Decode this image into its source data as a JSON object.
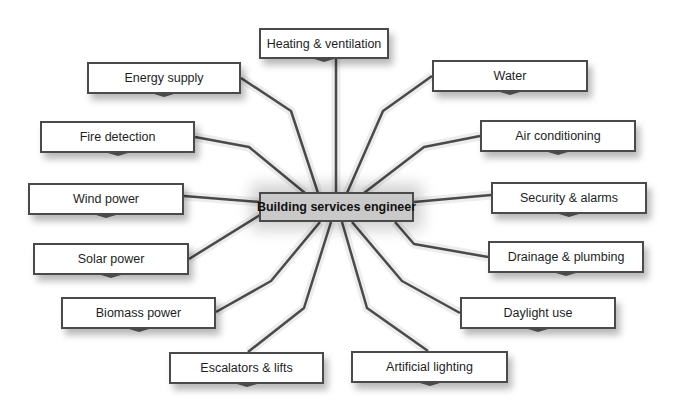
{
  "diagram": {
    "type": "mind-map",
    "center": {
      "label": "Building services engineer",
      "x": 259,
      "y": 192,
      "w": 155,
      "h": 30
    },
    "line_color": "#4a4a4a",
    "center_fill": "#c9c9c9",
    "nodes": [
      {
        "id": "heating",
        "label": "Heating & ventilation",
        "x": 259,
        "y": 28,
        "w": 130,
        "h": 31
      },
      {
        "id": "energy",
        "label": "Energy supply",
        "x": 87,
        "y": 62,
        "w": 154,
        "h": 32
      },
      {
        "id": "water",
        "label": "Water",
        "x": 432,
        "y": 60,
        "w": 156,
        "h": 32
      },
      {
        "id": "fire",
        "label": "Fire detection",
        "x": 40,
        "y": 121,
        "w": 155,
        "h": 32
      },
      {
        "id": "aircon",
        "label": "Air conditioning",
        "x": 480,
        "y": 120,
        "w": 156,
        "h": 32
      },
      {
        "id": "wind",
        "label": "Wind power",
        "x": 28,
        "y": 183,
        "w": 156,
        "h": 32
      },
      {
        "id": "security",
        "label": "Security & alarms",
        "x": 491,
        "y": 182,
        "w": 156,
        "h": 32
      },
      {
        "id": "solar",
        "label": "Solar power",
        "x": 33,
        "y": 243,
        "w": 156,
        "h": 32
      },
      {
        "id": "drainage",
        "label": "Drainage & plumbing",
        "x": 488,
        "y": 241,
        "w": 156,
        "h": 32
      },
      {
        "id": "biomass",
        "label": "Biomass power",
        "x": 61,
        "y": 297,
        "w": 155,
        "h": 32
      },
      {
        "id": "daylight",
        "label": "Daylight use",
        "x": 460,
        "y": 297,
        "w": 156,
        "h": 32
      },
      {
        "id": "escalators",
        "label": "Escalators & lifts",
        "x": 169,
        "y": 352,
        "w": 155,
        "h": 32
      },
      {
        "id": "lighting",
        "label": "Artificial lighting",
        "x": 351,
        "y": 351,
        "w": 157,
        "h": 32
      }
    ],
    "links": [
      {
        "to": "heating",
        "points": "336,59 336,193"
      },
      {
        "to": "energy",
        "points": "241,78 291,111 318,193"
      },
      {
        "to": "water",
        "points": "432,76 383,111 347,193"
      },
      {
        "to": "fire",
        "points": "195,137 249,147 305,193"
      },
      {
        "to": "aircon",
        "points": "480,136 424,147 364,193"
      },
      {
        "to": "wind",
        "points": "184,196 260,202"
      },
      {
        "to": "security",
        "points": "491,195 414,202"
      },
      {
        "to": "solar",
        "points": "189,259 260,215"
      },
      {
        "to": "drainage",
        "points": "488,257 414,244 395,222"
      },
      {
        "to": "biomass",
        "points": "216,312 271,281 320,222"
      },
      {
        "to": "daylight",
        "points": "460,313 402,281 352,222"
      },
      {
        "to": "escalators",
        "points": "248,352 304,308 331,222"
      },
      {
        "to": "lighting",
        "points": "428,351 367,308 342,222"
      }
    ]
  }
}
